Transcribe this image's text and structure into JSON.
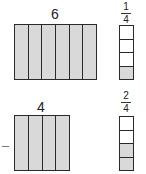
{
  "colors": {
    "shaded": "#d9d9d9",
    "unshaded": "#ffffff",
    "stroke": "#2a2a2a"
  },
  "top": {
    "bar_label": "6",
    "bar_parts": 6,
    "bar_shaded_parts": 6,
    "fraction": {
      "numerator": "1",
      "denominator": "4"
    },
    "strip_parts": 4,
    "strip_shaded_parts": 1
  },
  "bottom": {
    "bar_label": "4",
    "bar_parts": 4,
    "bar_shaded_parts": 4,
    "fraction": {
      "numerator": "2",
      "denominator": "4"
    },
    "strip_parts": 4,
    "strip_shaded_parts": 2,
    "left_mark": "–"
  }
}
